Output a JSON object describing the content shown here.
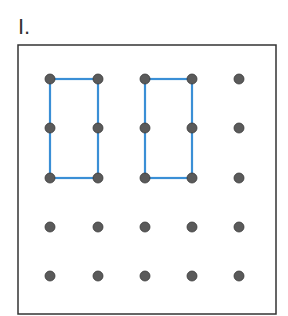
{
  "problem": {
    "number_label": "I."
  },
  "geoboard": {
    "rows": 5,
    "cols": 5,
    "dot_x": [
      50,
      98,
      145,
      192,
      239
    ],
    "dot_y": [
      79,
      128,
      178,
      227,
      276
    ],
    "colors": {
      "dot": "#5a5a5a",
      "dot_highlight": "#8a8a8a",
      "band": "#3a8fd6",
      "border": "#333333"
    },
    "rectangles": [
      {
        "name": "rectangle-1",
        "from": [
          0,
          0
        ],
        "to": [
          1,
          2
        ],
        "desc": "1 by 2 rectangle"
      },
      {
        "name": "rectangle-2",
        "from": [
          2,
          0
        ],
        "to": [
          3,
          2
        ],
        "desc": "1 by 2 rectangle"
      }
    ]
  }
}
